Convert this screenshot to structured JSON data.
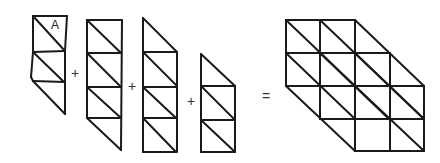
{
  "diagram": {
    "stroke_color": "#1a1a1a",
    "label_A": "A",
    "operators": {
      "plus_1": "+",
      "plus_2": "+",
      "plus_3": "+",
      "equals": "="
    },
    "shapes": [
      {
        "name": "strip-1",
        "triangles": 5,
        "edges": [
          [
            33,
            16,
            67,
            16
          ],
          [
            67,
            16,
            65,
            51
          ],
          [
            33,
            16,
            33,
            52
          ],
          [
            33,
            16,
            65,
            51
          ],
          [
            33,
            52,
            65,
            51
          ],
          [
            33,
            52,
            31,
            77
          ],
          [
            33,
            52,
            64,
            82
          ],
          [
            31,
            77,
            33,
            81
          ],
          [
            33,
            81,
            65,
            82
          ],
          [
            65,
            51,
            65,
            82
          ],
          [
            33,
            81,
            65,
            114
          ],
          [
            65,
            82,
            65,
            114
          ]
        ]
      },
      {
        "name": "strip-2",
        "triangles": 7,
        "edges": [
          [
            87,
            20,
            122,
            20
          ],
          [
            87,
            20,
            87,
            118
          ],
          [
            122,
            20,
            121,
            150
          ],
          [
            87,
            20,
            121,
            53
          ],
          [
            87,
            53,
            121,
            53
          ],
          [
            87,
            53,
            121,
            87
          ],
          [
            87,
            87,
            121,
            87
          ],
          [
            87,
            87,
            121,
            118
          ],
          [
            87,
            118,
            121,
            118
          ],
          [
            87,
            118,
            121,
            150
          ]
        ]
      },
      {
        "name": "strip-3",
        "triangles": 7,
        "edges": [
          [
            143,
            18,
            143,
            152
          ],
          [
            143,
            18,
            177,
            52
          ],
          [
            143,
            52,
            177,
            52
          ],
          [
            177,
            52,
            177,
            152
          ],
          [
            143,
            52,
            177,
            86
          ],
          [
            143,
            87,
            177,
            87
          ],
          [
            143,
            87,
            176,
            118
          ],
          [
            143,
            118,
            176,
            118
          ],
          [
            143,
            118,
            176,
            152
          ],
          [
            143,
            152,
            176,
            152
          ]
        ]
      },
      {
        "name": "strip-4",
        "triangles": 5,
        "edges": [
          [
            201,
            54,
            201,
            152
          ],
          [
            201,
            54,
            235,
            86
          ],
          [
            201,
            86,
            235,
            86
          ],
          [
            235,
            86,
            235,
            152
          ],
          [
            201,
            86,
            235,
            120
          ],
          [
            201,
            120,
            235,
            120
          ],
          [
            201,
            120,
            235,
            152
          ],
          [
            201,
            152,
            235,
            152
          ]
        ]
      },
      {
        "name": "result-grid",
        "triangles": 24,
        "edges": [
          [
            286,
            20,
            355,
            20
          ],
          [
            286,
            53,
            390,
            53
          ],
          [
            286,
            86,
            424,
            86
          ],
          [
            320,
            119,
            424,
            119
          ],
          [
            355,
            151,
            424,
            151
          ],
          [
            286,
            20,
            286,
            86
          ],
          [
            320,
            20,
            320,
            119
          ],
          [
            355,
            20,
            355,
            151
          ],
          [
            390,
            53,
            390,
            151
          ],
          [
            424,
            86,
            424,
            151
          ],
          [
            286,
            20,
            355,
            86
          ],
          [
            286,
            53,
            355,
            119
          ],
          [
            286,
            86,
            355,
            151
          ],
          [
            320,
            20,
            424,
            119
          ],
          [
            355,
            20,
            424,
            86
          ],
          [
            355,
            53,
            424,
            119
          ],
          [
            355,
            86,
            424,
            151
          ],
          [
            320,
            53,
            389,
            119
          ]
        ]
      }
    ]
  }
}
